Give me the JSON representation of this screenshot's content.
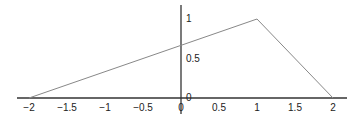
{
  "chart_data": {
    "type": "line",
    "title": "",
    "xlabel": "",
    "ylabel": "",
    "xlim": [
      -2.2,
      2.2
    ],
    "ylim": [
      0,
      1.1
    ],
    "grid": false,
    "legend": null,
    "x_ticks": [
      -2,
      -1.5,
      -1,
      -0.5,
      0,
      0.5,
      1,
      1.5,
      2
    ],
    "x_tick_labels": [
      "−2",
      "−1.5",
      "−1",
      "−0.5",
      "0",
      "0.5",
      "1",
      "1.5",
      "2"
    ],
    "y_ticks": [
      0,
      0.5,
      1
    ],
    "y_tick_labels": [
      "0",
      "0.5",
      "1"
    ],
    "series": [
      {
        "name": "piecewise linear",
        "color": "#888888",
        "x": [
          -2,
          1,
          2
        ],
        "y": [
          0,
          1,
          0
        ]
      }
    ],
    "annotations": []
  }
}
